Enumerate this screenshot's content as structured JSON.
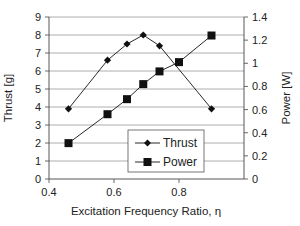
{
  "chart_data": {
    "type": "line",
    "title": "",
    "xlabel": "Excitation Frequency Ratio, η",
    "ylabel_left": "Thrust [g]",
    "ylabel_right": "Power [W]",
    "xlim": [
      0.4,
      1.0
    ],
    "ylim_left": [
      0,
      9
    ],
    "ylim_right": [
      0,
      1.4
    ],
    "x_ticks": [
      "0.4",
      "0.6",
      "0.8"
    ],
    "x_tick_values": [
      0.4,
      0.6,
      0.8
    ],
    "y_left_ticks": [
      "0",
      "1",
      "2",
      "3",
      "4",
      "5",
      "6",
      "7",
      "8",
      "9"
    ],
    "y_left_tick_values": [
      0,
      1,
      2,
      3,
      4,
      5,
      6,
      7,
      8,
      9
    ],
    "y_right_ticks": [
      "0",
      "0.2",
      "0.4",
      "0.6",
      "0.8",
      "1",
      "1.2",
      "1.4"
    ],
    "y_right_tick_values": [
      0,
      0.2,
      0.4,
      0.6,
      0.8,
      1.0,
      1.2,
      1.4
    ],
    "grid": true,
    "legend_position": "bottom-right",
    "series": [
      {
        "name": "Thrust",
        "axis": "left",
        "marker": "diamond",
        "x": [
          0.46,
          0.58,
          0.64,
          0.69,
          0.74,
          0.9
        ],
        "values": [
          3.9,
          6.6,
          7.5,
          8.0,
          7.4,
          3.9
        ]
      },
      {
        "name": "Power",
        "axis": "right",
        "marker": "square",
        "x": [
          0.46,
          0.58,
          0.64,
          0.69,
          0.74,
          0.8,
          0.9
        ],
        "values": [
          0.31,
          0.56,
          0.69,
          0.82,
          0.93,
          1.01,
          1.24
        ]
      }
    ],
    "colors": {
      "series": "#111111",
      "grid": "#9a9a9a",
      "axis": "#444444",
      "text": "#222222"
    }
  }
}
